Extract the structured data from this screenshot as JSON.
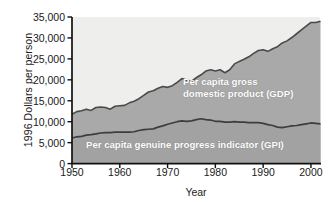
{
  "chart_data": {
    "type": "area",
    "title": "",
    "subtitle": "",
    "xlabel": "Year",
    "ylabel": "1996 Dollars per person",
    "xlim": [
      1950,
      2002
    ],
    "ylim": [
      0,
      35000
    ],
    "grid": false,
    "legend_position": "in-plot annotations",
    "y_ticks": [
      0,
      5000,
      10000,
      15000,
      20000,
      25000,
      30000,
      35000
    ],
    "y_tick_labels": [
      "0",
      "5,000",
      "10,000",
      "15,000",
      "20,000",
      "25,000",
      "30,000",
      "35,000"
    ],
    "x_ticks": [
      1950,
      1960,
      1970,
      1980,
      1990,
      2000
    ],
    "x_tick_labels": [
      "1950",
      "1960",
      "1970",
      "1980",
      "1990",
      "2000"
    ],
    "stacking": "overlaid",
    "colors": {
      "plot_background": "#eeeeec",
      "gdp_band_fill": "#a9a9a9",
      "gpi_band_fill": "#a2a2a2",
      "gdp_line": "#4a4a4a",
      "gpi_line": "#3d3d3d",
      "axis": "#111111",
      "series_label_text": "#fdfdfd"
    },
    "x": [
      1950,
      1951,
      1952,
      1953,
      1954,
      1955,
      1956,
      1957,
      1958,
      1959,
      1960,
      1961,
      1962,
      1963,
      1964,
      1965,
      1966,
      1967,
      1968,
      1969,
      1970,
      1971,
      1972,
      1973,
      1974,
      1975,
      1976,
      1977,
      1978,
      1979,
      1980,
      1981,
      1982,
      1983,
      1984,
      1985,
      1986,
      1987,
      1988,
      1989,
      1990,
      1991,
      1992,
      1993,
      1994,
      1995,
      1996,
      1997,
      1998,
      1999,
      2000,
      2001,
      2002
    ],
    "series": [
      {
        "name": "Per capita gross domestic product (GDP)",
        "label": "Per capita gross domestic product (GDP)",
        "short_name": "GDP",
        "values": [
          11800,
          12400,
          12600,
          13000,
          12700,
          13400,
          13500,
          13400,
          13000,
          13700,
          13800,
          13900,
          14500,
          14900,
          15500,
          16300,
          17100,
          17400,
          18000,
          18400,
          18200,
          18600,
          19400,
          20300,
          19900,
          19600,
          20500,
          21200,
          22100,
          22400,
          22100,
          22400,
          21700,
          22400,
          23800,
          24400,
          24900,
          25500,
          26300,
          27000,
          27200,
          26800,
          27400,
          27900,
          28800,
          29300,
          30100,
          31000,
          31900,
          32800,
          33700,
          33700,
          34000
        ]
      },
      {
        "name": "Per capita genuine progress indicator (GPI)",
        "label": "Per capita genuine progress indicator (GPI)",
        "short_name": "GPI",
        "values": [
          6100,
          6400,
          6500,
          6800,
          6900,
          7100,
          7300,
          7400,
          7400,
          7500,
          7500,
          7500,
          7500,
          7600,
          7900,
          8100,
          8200,
          8300,
          8700,
          9000,
          9400,
          9700,
          10000,
          10200,
          10100,
          10200,
          10500,
          10700,
          10500,
          10400,
          10100,
          10100,
          9900,
          9900,
          10000,
          9900,
          9900,
          9800,
          9800,
          9800,
          9600,
          9300,
          9100,
          8700,
          8600,
          8800,
          9000,
          9100,
          9300,
          9500,
          9700,
          9600,
          9500
        ]
      }
    ],
    "annotations": [
      {
        "text_line_1": "Per capita gross",
        "text_line_2": "domestic product (GDP)",
        "at_series": "GDP"
      },
      {
        "text_line_1": "Per capita genuine progress indicator (GPI)",
        "text_line_2": "",
        "at_series": "GPI"
      }
    ]
  }
}
